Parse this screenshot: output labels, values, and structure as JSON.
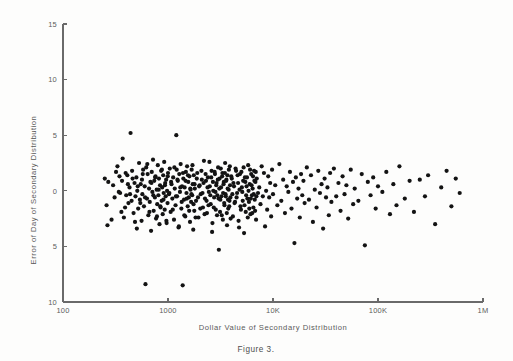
{
  "figure": {
    "caption": "Figure 3.",
    "background_color": "#fdfdfc",
    "point_color": "#131313",
    "axis_color": "#6a6a6a"
  },
  "chart_data": {
    "type": "scatter",
    "title": "",
    "xlabel": "Dollar Value of Secondary Distribution",
    "ylabel": "Error of Day of Secondary Distribution",
    "xscale": "log",
    "xlim": [
      100,
      1000000
    ],
    "ylim": [
      -10,
      15
    ],
    "grid": false,
    "legend": null,
    "x_tick_labels": [
      "100",
      "1000",
      "10K",
      "100K",
      "1M"
    ],
    "x_tick_values": [
      100,
      1000,
      10000,
      100000,
      1000000
    ],
    "y_tick_labels": [
      "15",
      "10",
      "5",
      "0",
      "5",
      "10"
    ],
    "y_tick_values": [
      15,
      10,
      5,
      0,
      -5,
      -10
    ],
    "marker": "filled-circle",
    "marker_size_px": 3.1,
    "n_points": 318,
    "points": [
      [
        250,
        1.1
      ],
      [
        260,
        -1.3
      ],
      [
        265,
        -3.1
      ],
      [
        300,
        0.5
      ],
      [
        310,
        -0.6
      ],
      [
        330,
        2.2
      ],
      [
        345,
        1.3
      ],
      [
        350,
        -0.2
      ],
      [
        360,
        -1.9
      ],
      [
        365,
        0.9
      ],
      [
        380,
        -2.4
      ],
      [
        395,
        1.6
      ],
      [
        400,
        -0.4
      ],
      [
        410,
        1.4
      ],
      [
        420,
        -1.1
      ],
      [
        430,
        0.3
      ],
      [
        440,
        5.2
      ],
      [
        450,
        -0.9
      ],
      [
        455,
        1.8
      ],
      [
        470,
        -2.0
      ],
      [
        480,
        0.7
      ],
      [
        490,
        -0.5
      ],
      [
        500,
        1.2
      ],
      [
        505,
        -3.4
      ],
      [
        510,
        0.0
      ],
      [
        520,
        -1.6
      ],
      [
        530,
        2.5
      ],
      [
        540,
        -0.8
      ],
      [
        550,
        0.6
      ],
      [
        560,
        -2.7
      ],
      [
        565,
        1.0
      ],
      [
        570,
        -0.3
      ],
      [
        580,
        1.9
      ],
      [
        590,
        -1.4
      ],
      [
        600,
        0.4
      ],
      [
        610,
        -8.4
      ],
      [
        620,
        2.1
      ],
      [
        630,
        -0.7
      ],
      [
        640,
        1.5
      ],
      [
        650,
        -2.2
      ],
      [
        660,
        0.2
      ],
      [
        670,
        -1.0
      ],
      [
        680,
        0.8
      ],
      [
        690,
        -3.6
      ],
      [
        700,
        1.7
      ],
      [
        710,
        -0.1
      ],
      [
        720,
        2.8
      ],
      [
        730,
        -1.8
      ],
      [
        740,
        0.9
      ],
      [
        750,
        -0.6
      ],
      [
        760,
        1.3
      ],
      [
        770,
        -2.5
      ],
      [
        780,
        0.1
      ],
      [
        790,
        -1.2
      ],
      [
        800,
        2.3
      ],
      [
        810,
        -0.4
      ],
      [
        820,
        1.1
      ],
      [
        830,
        -3.0
      ],
      [
        840,
        0.5
      ],
      [
        850,
        -1.5
      ],
      [
        860,
        1.8
      ],
      [
        870,
        -0.9
      ],
      [
        880,
        0.3
      ],
      [
        890,
        -2.1
      ],
      [
        900,
        1.4
      ],
      [
        910,
        -0.2
      ],
      [
        920,
        2.6
      ],
      [
        930,
        -1.7
      ],
      [
        940,
        0.7
      ],
      [
        950,
        -0.5
      ],
      [
        960,
        1.0
      ],
      [
        970,
        -2.9
      ],
      [
        980,
        0.0
      ],
      [
        990,
        -1.1
      ],
      [
        1000,
        1.6
      ],
      [
        1020,
        -0.3
      ],
      [
        1040,
        2.0
      ],
      [
        1060,
        -1.9
      ],
      [
        1080,
        0.6
      ],
      [
        1100,
        -0.7
      ],
      [
        1120,
        1.2
      ],
      [
        1140,
        -2.6
      ],
      [
        1160,
        0.2
      ],
      [
        1180,
        -1.3
      ],
      [
        1200,
        5.0
      ],
      [
        1210,
        1.9
      ],
      [
        1220,
        -0.5
      ],
      [
        1240,
        0.9
      ],
      [
        1260,
        -3.3
      ],
      [
        1280,
        1.5
      ],
      [
        1300,
        -0.1
      ],
      [
        1320,
        2.4
      ],
      [
        1340,
        -1.6
      ],
      [
        1360,
        0.4
      ],
      [
        1380,
        -8.5
      ],
      [
        1400,
        1.1
      ],
      [
        1420,
        -0.8
      ],
      [
        1440,
        0.3
      ],
      [
        1460,
        -2.3
      ],
      [
        1480,
        1.7
      ],
      [
        1500,
        -0.2
      ],
      [
        1520,
        2.2
      ],
      [
        1540,
        -1.4
      ],
      [
        1560,
        0.8
      ],
      [
        1580,
        -0.6
      ],
      [
        1600,
        1.3
      ],
      [
        1620,
        -2.8
      ],
      [
        1640,
        0.1
      ],
      [
        1660,
        -1.0
      ],
      [
        1680,
        1.9
      ],
      [
        1700,
        -0.4
      ],
      [
        1720,
        0.6
      ],
      [
        1740,
        -3.5
      ],
      [
        1760,
        1.4
      ],
      [
        1780,
        -1.8
      ],
      [
        1800,
        0.2
      ],
      [
        1850,
        -0.9
      ],
      [
        1900,
        1.6
      ],
      [
        1950,
        -2.4
      ],
      [
        2000,
        0.5
      ],
      [
        2050,
        -0.3
      ],
      [
        2100,
        1.0
      ],
      [
        2150,
        -1.5
      ],
      [
        2200,
        2.7
      ],
      [
        2250,
        -0.7
      ],
      [
        2300,
        0.9
      ],
      [
        2350,
        -2.0
      ],
      [
        2400,
        1.2
      ],
      [
        2450,
        -0.1
      ],
      [
        2500,
        0.4
      ],
      [
        2550,
        -1.2
      ],
      [
        2600,
        1.8
      ],
      [
        2650,
        -2.9
      ],
      [
        2700,
        0.0
      ],
      [
        2750,
        -0.6
      ],
      [
        2800,
        1.5
      ],
      [
        2850,
        -1.7
      ],
      [
        2900,
        0.7
      ],
      [
        2950,
        -0.4
      ],
      [
        3000,
        2.1
      ],
      [
        3050,
        -5.3
      ],
      [
        3100,
        1.1
      ],
      [
        3150,
        -0.8
      ],
      [
        3200,
        0.3
      ],
      [
        3250,
        -2.2
      ],
      [
        3300,
        1.6
      ],
      [
        3350,
        -0.2
      ],
      [
        3400,
        0.8
      ],
      [
        3450,
        -1.3
      ],
      [
        3500,
        2.5
      ],
      [
        3550,
        -0.5
      ],
      [
        3600,
        1.0
      ],
      [
        3650,
        -3.1
      ],
      [
        3700,
        0.2
      ],
      [
        3750,
        -1.6
      ],
      [
        3800,
        1.9
      ],
      [
        3850,
        -0.9
      ],
      [
        3900,
        0.5
      ],
      [
        3950,
        -2.5
      ],
      [
        4000,
        1.3
      ],
      [
        4100,
        -0.3
      ],
      [
        4200,
        0.7
      ],
      [
        4300,
        -1.1
      ],
      [
        4400,
        2.0
      ],
      [
        4500,
        -0.6
      ],
      [
        4600,
        1.4
      ],
      [
        4700,
        -2.7
      ],
      [
        4800,
        0.1
      ],
      [
        4900,
        -1.4
      ],
      [
        5000,
        1.7
      ],
      [
        5100,
        -0.1
      ],
      [
        5200,
        0.9
      ],
      [
        5300,
        -3.8
      ],
      [
        5400,
        1.2
      ],
      [
        5500,
        -1.9
      ],
      [
        5600,
        0.4
      ],
      [
        5700,
        -0.7
      ],
      [
        5800,
        2.3
      ],
      [
        5900,
        -1.0
      ],
      [
        6000,
        0.6
      ],
      [
        6100,
        -2.1
      ],
      [
        6200,
        1.5
      ],
      [
        6300,
        -0.4
      ],
      [
        6400,
        0.2
      ],
      [
        6500,
        -1.5
      ],
      [
        6600,
        1.8
      ],
      [
        6700,
        -0.8
      ],
      [
        6800,
        0.8
      ],
      [
        6900,
        -2.6
      ],
      [
        7000,
        1.1
      ],
      [
        7200,
        -0.2
      ],
      [
        7400,
        0.3
      ],
      [
        7600,
        -1.2
      ],
      [
        7800,
        2.2
      ],
      [
        8000,
        -0.5
      ],
      [
        8200,
        1.6
      ],
      [
        8400,
        -3.2
      ],
      [
        8600,
        0.0
      ],
      [
        8800,
        -1.7
      ],
      [
        9000,
        1.3
      ],
      [
        9200,
        -0.6
      ],
      [
        9400,
        0.7
      ],
      [
        9600,
        -2.3
      ],
      [
        9800,
        1.9
      ],
      [
        10000,
        -0.3
      ],
      [
        10500,
        0.5
      ],
      [
        11000,
        -1.3
      ],
      [
        11500,
        2.4
      ],
      [
        12000,
        -0.9
      ],
      [
        12500,
        1.0
      ],
      [
        13000,
        -2.0
      ],
      [
        13500,
        0.4
      ],
      [
        14000,
        -0.1
      ],
      [
        14500,
        1.7
      ],
      [
        15000,
        -1.6
      ],
      [
        15500,
        0.8
      ],
      [
        16000,
        -4.7
      ],
      [
        16500,
        1.2
      ],
      [
        17000,
        -0.7
      ],
      [
        17500,
        0.2
      ],
      [
        18000,
        -2.4
      ],
      [
        18500,
        1.5
      ],
      [
        19000,
        -0.4
      ],
      [
        19500,
        0.9
      ],
      [
        20000,
        -1.1
      ],
      [
        21000,
        2.1
      ],
      [
        22000,
        -0.8
      ],
      [
        23000,
        1.4
      ],
      [
        24000,
        -2.8
      ],
      [
        25000,
        0.1
      ],
      [
        26000,
        -1.5
      ],
      [
        27000,
        1.8
      ],
      [
        28000,
        -0.2
      ],
      [
        29000,
        0.6
      ],
      [
        30000,
        -3.4
      ],
      [
        31000,
        1.1
      ],
      [
        32000,
        -0.6
      ],
      [
        33000,
        0.3
      ],
      [
        34000,
        -2.2
      ],
      [
        35000,
        1.6
      ],
      [
        36000,
        -1.0
      ],
      [
        38000,
        2.0
      ],
      [
        40000,
        -0.5
      ],
      [
        42000,
        0.7
      ],
      [
        44000,
        -1.8
      ],
      [
        46000,
        1.3
      ],
      [
        48000,
        -0.3
      ],
      [
        50000,
        0.5
      ],
      [
        52000,
        -2.5
      ],
      [
        55000,
        1.9
      ],
      [
        58000,
        -1.2
      ],
      [
        60000,
        0.2
      ],
      [
        65000,
        -0.9
      ],
      [
        70000,
        1.5
      ],
      [
        75000,
        -4.9
      ],
      [
        80000,
        0.8
      ],
      [
        85000,
        -0.4
      ],
      [
        90000,
        1.2
      ],
      [
        95000,
        -1.6
      ],
      [
        100000,
        0.4
      ],
      [
        110000,
        -0.1
      ],
      [
        120000,
        1.7
      ],
      [
        130000,
        -2.1
      ],
      [
        140000,
        0.6
      ],
      [
        150000,
        -1.3
      ],
      [
        160000,
        2.2
      ],
      [
        180000,
        -0.7
      ],
      [
        200000,
        0.9
      ],
      [
        220000,
        -1.9
      ],
      [
        250000,
        1.0
      ],
      [
        280000,
        -0.5
      ],
      [
        300000,
        1.4
      ],
      [
        350000,
        -3.0
      ],
      [
        400000,
        0.3
      ],
      [
        450000,
        1.8
      ],
      [
        500000,
        -1.4
      ],
      [
        550000,
        1.1
      ],
      [
        600000,
        -0.2
      ],
      [
        270,
        0.8
      ],
      [
        290,
        -2.6
      ],
      [
        320,
        1.7
      ],
      [
        340,
        -0.1
      ],
      [
        370,
        2.9
      ],
      [
        390,
        -1.5
      ],
      [
        415,
        0.6
      ],
      [
        435,
        -0.3
      ],
      [
        460,
        1.1
      ],
      [
        485,
        -2.8
      ],
      [
        515,
        0.4
      ],
      [
        545,
        -1.1
      ],
      [
        575,
        1.5
      ],
      [
        605,
        -0.6
      ],
      [
        635,
        2.4
      ],
      [
        665,
        -1.9
      ],
      [
        695,
        0.7
      ],
      [
        725,
        -0.4
      ],
      [
        755,
        1.2
      ],
      [
        785,
        -2.3
      ],
      [
        815,
        0.1
      ],
      [
        845,
        -1.4
      ],
      [
        875,
        1.9
      ],
      [
        905,
        -0.8
      ],
      [
        935,
        0.5
      ],
      [
        965,
        -2.7
      ],
      [
        995,
        1.3
      ],
      [
        1030,
        -0.2
      ],
      [
        1070,
        0.8
      ],
      [
        1110,
        -1.7
      ],
      [
        1150,
        2.1
      ],
      [
        1190,
        -0.5
      ],
      [
        1230,
        1.0
      ],
      [
        1270,
        -3.2
      ],
      [
        1310,
        0.3
      ],
      [
        1350,
        -1.0
      ],
      [
        1390,
        1.6
      ],
      [
        1430,
        -2.2
      ],
      [
        1470,
        0.9
      ],
      [
        1510,
        -0.7
      ],
      [
        1550,
        1.4
      ],
      [
        1590,
        -1.8
      ],
      [
        1630,
        0.2
      ],
      [
        1670,
        -0.3
      ],
      [
        1710,
        2.3
      ],
      [
        1750,
        -1.2
      ],
      [
        1790,
        0.6
      ],
      [
        1830,
        -2.4
      ],
      [
        1880,
        1.1
      ],
      [
        1930,
        -0.6
      ],
      [
        1980,
        0.4
      ],
      [
        2030,
        -1.6
      ],
      [
        2080,
        1.8
      ],
      [
        2130,
        -0.2
      ],
      [
        2180,
        0.7
      ],
      [
        2230,
        -2.1
      ],
      [
        2280,
        1.5
      ],
      [
        2330,
        -0.9
      ],
      [
        2380,
        0.3
      ],
      [
        2430,
        -1.3
      ],
      [
        2480,
        2.6
      ],
      [
        2530,
        -0.4
      ],
      [
        2580,
        1.2
      ],
      [
        2630,
        -3.7
      ],
      [
        2680,
        0.8
      ],
      [
        2730,
        -1.5
      ],
      [
        2780,
        1.7
      ],
      [
        2830,
        -0.1
      ],
      [
        2880,
        0.5
      ],
      [
        2930,
        -2.2
      ],
      [
        2980,
        1.0
      ],
      [
        3030,
        -0.7
      ],
      [
        3080,
        0.2
      ],
      [
        3130,
        -1.9
      ],
      [
        3180,
        2.0
      ],
      [
        3230,
        -0.5
      ],
      [
        3280,
        1.3
      ],
      [
        3330,
        -2.6
      ],
      [
        3380,
        0.6
      ],
      [
        3430,
        -1.1
      ],
      [
        3480,
        1.6
      ],
      [
        3530,
        -0.3
      ],
      [
        3580,
        0.9
      ],
      [
        3630,
        -2.0
      ],
      [
        3680,
        1.4
      ],
      [
        3730,
        -0.8
      ],
      [
        3780,
        0.1
      ],
      [
        3830,
        -1.4
      ],
      [
        3880,
        2.2
      ],
      [
        3930,
        -0.6
      ],
      [
        4050,
        1.1
      ],
      [
        4150,
        -2.3
      ],
      [
        4250,
        0.4
      ],
      [
        4350,
        -1.0
      ],
      [
        4450,
        1.8
      ],
      [
        4550,
        -0.2
      ],
      [
        4650,
        0.7
      ],
      [
        4750,
        -3.3
      ],
      [
        4850,
        1.5
      ],
      [
        4950,
        -1.7
      ],
      [
        5050,
        0.3
      ],
      [
        5150,
        -0.9
      ],
      [
        5250,
        2.1
      ],
      [
        5350,
        -1.3
      ],
      [
        5450,
        0.8
      ],
      [
        5550,
        -0.4
      ],
      [
        5650,
        1.2
      ],
      [
        5750,
        -2.4
      ],
      [
        5850,
        0.0
      ],
      [
        5950,
        -1.6
      ],
      [
        6050,
        1.9
      ],
      [
        6150,
        -0.7
      ],
      [
        6250,
        0.5
      ],
      [
        6350,
        -2.0
      ],
      [
        6450,
        1.3
      ],
      [
        6550,
        -0.3
      ],
      [
        6650,
        0.9
      ],
      [
        6750,
        -1.8
      ],
      [
        6850,
        1.7
      ],
      [
        6950,
        -0.5
      ]
    ]
  }
}
